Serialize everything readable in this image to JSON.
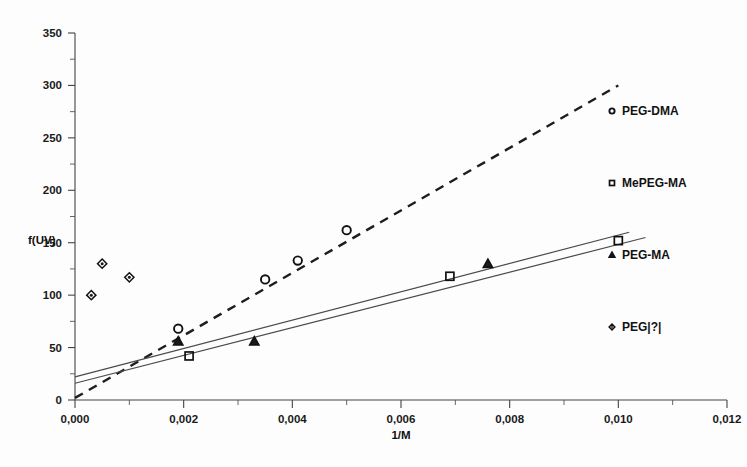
{
  "chart_data": {
    "type": "scatter",
    "title": "",
    "xlabel": "1/M",
    "ylabel": "f(UV)",
    "xlim": [
      0.0,
      0.012
    ],
    "ylim": [
      0,
      350
    ],
    "xticks": [
      0.0,
      0.002,
      0.004,
      0.006,
      0.008,
      0.01,
      0.012
    ],
    "xtick_labels": [
      "0,000",
      "0,002",
      "0,004",
      "0,006",
      "0,008",
      "0,010",
      "0,012"
    ],
    "yticks": [
      0,
      50,
      100,
      150,
      200,
      250,
      300,
      350
    ],
    "ytick_labels": [
      "0",
      "50",
      "100",
      "150",
      "200",
      "250",
      "300",
      "350"
    ],
    "y_minor_step": 25,
    "grid": false,
    "legend_position": "right",
    "decimal_separator": ",",
    "series": [
      {
        "name": "PEG-DMA",
        "marker": "circle",
        "points": [
          {
            "x": 0.0019,
            "y": 68
          },
          {
            "x": 0.0035,
            "y": 115
          },
          {
            "x": 0.0041,
            "y": 133
          },
          {
            "x": 0.005,
            "y": 162
          }
        ],
        "fit": {
          "style": "dashed",
          "x0": 0.0,
          "y0": 2,
          "x1": 0.01,
          "y1": 300
        }
      },
      {
        "name": "MePEG-MA",
        "marker": "square",
        "points": [
          {
            "x": 0.0021,
            "y": 42
          },
          {
            "x": 0.0069,
            "y": 118
          },
          {
            "x": 0.01,
            "y": 152
          }
        ],
        "fit": {
          "style": "solid",
          "x0": 0.0,
          "y0": 16,
          "x1": 0.0105,
          "y1": 155
        }
      },
      {
        "name": "PEG-MA",
        "marker": "triangle",
        "points": [
          {
            "x": 0.0019,
            "y": 56
          },
          {
            "x": 0.0033,
            "y": 56
          },
          {
            "x": 0.0076,
            "y": 130
          }
        ],
        "fit": {
          "style": "solid",
          "x0": 0.0,
          "y0": 22,
          "x1": 0.0102,
          "y1": 160
        }
      },
      {
        "name": "PEG|?|",
        "marker": "diamond",
        "points": [
          {
            "x": 0.0003,
            "y": 100
          },
          {
            "x": 0.0005,
            "y": 130
          },
          {
            "x": 0.001,
            "y": 117
          }
        ],
        "fit": null
      }
    ],
    "legend": [
      {
        "label": "PEG-DMA",
        "marker": "circle"
      },
      {
        "label": "MePEG-MA",
        "marker": "square"
      },
      {
        "label": "PEG-MA",
        "marker": "triangle"
      },
      {
        "label": "PEG|?|",
        "marker": "diamond"
      }
    ]
  },
  "colors": {
    "ink": "#1a1a1a",
    "axis": "#444444",
    "fit_solid": "#4a4a4a",
    "background": "#ffffff"
  }
}
